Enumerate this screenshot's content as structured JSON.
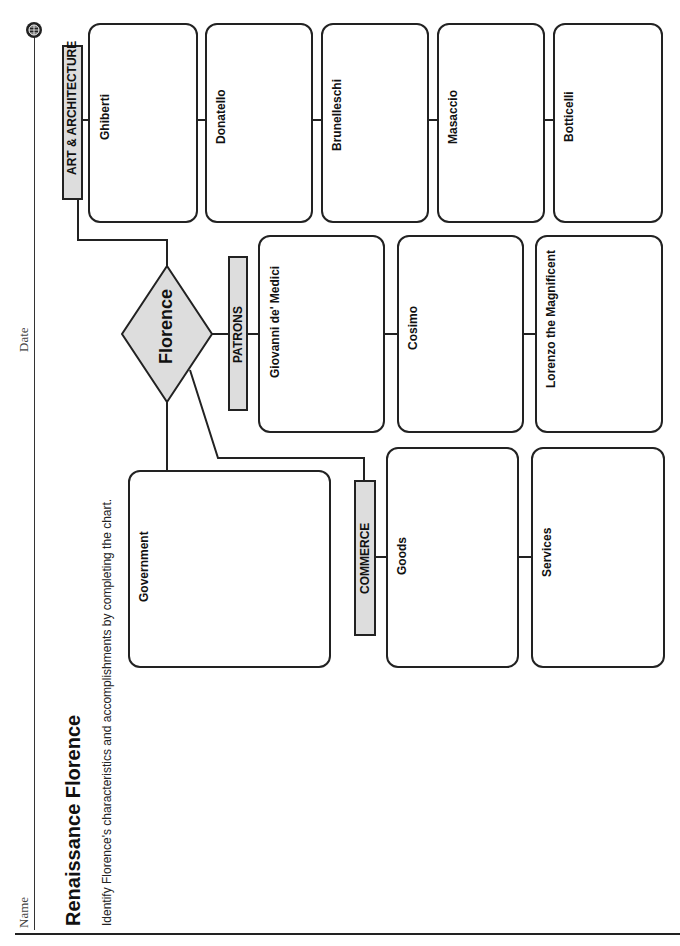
{
  "header": {
    "name_label": "Name",
    "date_label": "Date",
    "globe_icon": "globe-icon"
  },
  "title": "Renaissance Florence",
  "instructions": "Identify Florence's characteristics and accomplishments by completing the chart.",
  "center": {
    "label": "Florence"
  },
  "categories": {
    "art": {
      "label": "ART & ARCHITECTURE",
      "items": [
        "Ghiberti",
        "Donatello",
        "Brunelleschi",
        "Masaccio",
        "Botticelli"
      ]
    },
    "patrons": {
      "label": "PATRONS",
      "items": [
        "Giovanni de' Medici",
        "Cosimo",
        "Lorenzo the Magnificent"
      ]
    },
    "government": {
      "label": "Government"
    },
    "commerce": {
      "label": "COMMERCE",
      "items": [
        "Goods",
        "Services"
      ]
    }
  },
  "colors": {
    "label_fill": "#dddddd",
    "stroke": "#222222"
  }
}
